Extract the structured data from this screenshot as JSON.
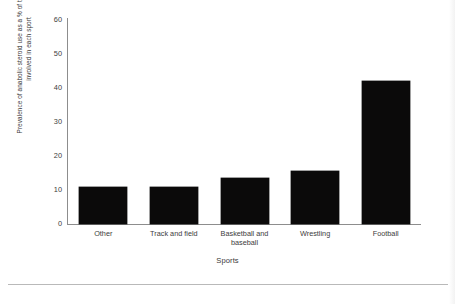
{
  "chart_data": {
    "type": "bar",
    "title": "",
    "xlabel": "Sports",
    "ylabel": "Prevalence of anabolic steroid use as a % of total athletes involved in each sport",
    "categories": [
      "Other",
      "Track and field",
      "Basketball and baseball",
      "Wrestling",
      "Football"
    ],
    "values": [
      11,
      11,
      13.5,
      15.5,
      42
    ],
    "ylim": [
      0,
      60
    ],
    "yticks": [
      0,
      10,
      20,
      30,
      40,
      50,
      60
    ],
    "ytick_labels": [
      "0",
      "10",
      "20",
      "30",
      "40",
      "50",
      "60"
    ],
    "grid": false,
    "legend": null,
    "bar_color": "#0b0a0a",
    "axis_color": "#8d8d8d",
    "background_color": "#ffffff"
  },
  "axis": {
    "y_title": "Prevalence of anabolic steroid use as a % of total athletes involved in each sport",
    "x_title": "Sports"
  }
}
